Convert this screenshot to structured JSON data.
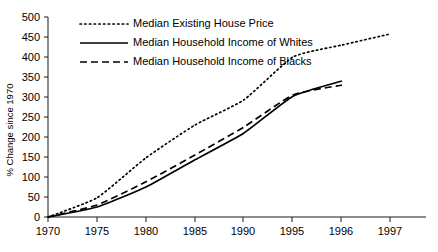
{
  "chart_data": {
    "type": "line",
    "title": "",
    "xlabel": "",
    "ylabel": "% Change since 1970",
    "ylim": [
      0,
      500
    ],
    "ytick_step": 50,
    "grid": false,
    "legend_position": "top-left",
    "x_axis_note": "categorical, evenly spaced ticks",
    "categories": [
      "1970",
      "1975",
      "1980",
      "1985",
      "1990",
      "1995",
      "1996",
      "1997"
    ],
    "yticks": [
      "0",
      "50",
      "100",
      "150",
      "200",
      "250",
      "300",
      "350",
      "400",
      "450",
      "500"
    ],
    "series": [
      {
        "name": "Median Existing House Price",
        "style": "dotted",
        "color": "#000000",
        "x": [
          "1970",
          "1975",
          "1980",
          "1985",
          "1990",
          "1995",
          "1996",
          "1997"
        ],
        "values": [
          0,
          48,
          148,
          230,
          293,
          400,
          430,
          458
        ]
      },
      {
        "name": "Median Household Income of Whites",
        "style": "solid",
        "color": "#000000",
        "x": [
          "1970",
          "1975",
          "1980",
          "1985",
          "1990",
          "1995",
          "1996"
        ],
        "values": [
          0,
          25,
          75,
          143,
          210,
          302,
          340
        ]
      },
      {
        "name": "Median Household Income of Blacks",
        "style": "dashed",
        "color": "#000000",
        "x": [
          "1970",
          "1975",
          "1980",
          "1985",
          "1990",
          "1995",
          "1996"
        ],
        "values": [
          0,
          30,
          88,
          155,
          225,
          305,
          330
        ]
      }
    ]
  },
  "legend": {
    "items": [
      {
        "label": "Median Existing House Price",
        "style": "dotted"
      },
      {
        "label": "Median Household Income of Whites",
        "style": "solid"
      },
      {
        "label": "Median Household Income of Blacks",
        "style": "dashed"
      }
    ]
  },
  "axes": {
    "y_title": "% Change since 1970"
  }
}
